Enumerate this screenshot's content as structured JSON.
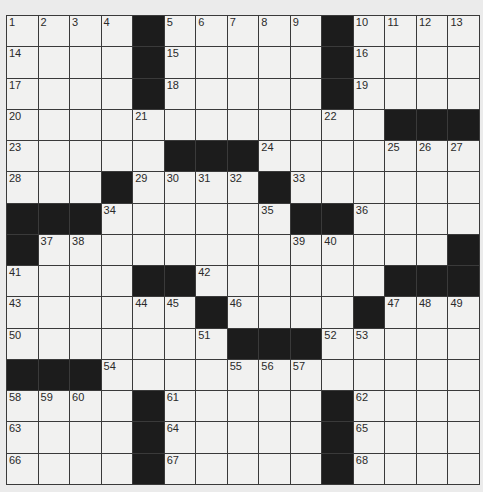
{
  "puzzle": {
    "rows": 15,
    "cols": 15,
    "layout": [
      "....#.....#....",
      "....#.....#....",
      "....#.....#....",
      "............###",
      ".....###.......",
      "...#....#......",
      "###......##....",
      "#.............#",
      "....##......###",
      "......#....#...",
      ".......###.....",
      "###............",
      "....#.....#....",
      "....#.....#....",
      "....#.....#...."
    ],
    "clue_numbers": [
      {
        "row": 0,
        "col": 0,
        "n": "1"
      },
      {
        "row": 0,
        "col": 1,
        "n": "2"
      },
      {
        "row": 0,
        "col": 2,
        "n": "3"
      },
      {
        "row": 0,
        "col": 3,
        "n": "4"
      },
      {
        "row": 0,
        "col": 5,
        "n": "5"
      },
      {
        "row": 0,
        "col": 6,
        "n": "6"
      },
      {
        "row": 0,
        "col": 7,
        "n": "7"
      },
      {
        "row": 0,
        "col": 8,
        "n": "8"
      },
      {
        "row": 0,
        "col": 9,
        "n": "9"
      },
      {
        "row": 0,
        "col": 11,
        "n": "10"
      },
      {
        "row": 0,
        "col": 12,
        "n": "11"
      },
      {
        "row": 0,
        "col": 13,
        "n": "12"
      },
      {
        "row": 0,
        "col": 14,
        "n": "13"
      },
      {
        "row": 1,
        "col": 0,
        "n": "14"
      },
      {
        "row": 1,
        "col": 5,
        "n": "15"
      },
      {
        "row": 1,
        "col": 11,
        "n": "16"
      },
      {
        "row": 2,
        "col": 0,
        "n": "17"
      },
      {
        "row": 2,
        "col": 5,
        "n": "18"
      },
      {
        "row": 2,
        "col": 11,
        "n": "19"
      },
      {
        "row": 3,
        "col": 0,
        "n": "20"
      },
      {
        "row": 3,
        "col": 4,
        "n": "21"
      },
      {
        "row": 3,
        "col": 10,
        "n": "22"
      },
      {
        "row": 4,
        "col": 0,
        "n": "23"
      },
      {
        "row": 4,
        "col": 8,
        "n": "24"
      },
      {
        "row": 4,
        "col": 12,
        "n": "25"
      },
      {
        "row": 4,
        "col": 13,
        "n": "26"
      },
      {
        "row": 4,
        "col": 14,
        "n": "27"
      },
      {
        "row": 5,
        "col": 0,
        "n": "28"
      },
      {
        "row": 5,
        "col": 4,
        "n": "29"
      },
      {
        "row": 5,
        "col": 5,
        "n": "30"
      },
      {
        "row": 5,
        "col": 6,
        "n": "31"
      },
      {
        "row": 5,
        "col": 7,
        "n": "32"
      },
      {
        "row": 5,
        "col": 9,
        "n": "33"
      },
      {
        "row": 6,
        "col": 3,
        "n": "34"
      },
      {
        "row": 6,
        "col": 8,
        "n": "35"
      },
      {
        "row": 6,
        "col": 11,
        "n": "36"
      },
      {
        "row": 7,
        "col": 1,
        "n": "37"
      },
      {
        "row": 7,
        "col": 2,
        "n": "38"
      },
      {
        "row": 7,
        "col": 9,
        "n": "39"
      },
      {
        "row": 7,
        "col": 10,
        "n": "40"
      },
      {
        "row": 8,
        "col": 0,
        "n": "41"
      },
      {
        "row": 8,
        "col": 6,
        "n": "42"
      },
      {
        "row": 9,
        "col": 0,
        "n": "43"
      },
      {
        "row": 9,
        "col": 4,
        "n": "44"
      },
      {
        "row": 9,
        "col": 5,
        "n": "45"
      },
      {
        "row": 9,
        "col": 7,
        "n": "46"
      },
      {
        "row": 9,
        "col": 12,
        "n": "47"
      },
      {
        "row": 9,
        "col": 13,
        "n": "48"
      },
      {
        "row": 9,
        "col": 14,
        "n": "49"
      },
      {
        "row": 10,
        "col": 0,
        "n": "50"
      },
      {
        "row": 10,
        "col": 6,
        "n": "51"
      },
      {
        "row": 10,
        "col": 10,
        "n": "52"
      },
      {
        "row": 10,
        "col": 11,
        "n": "53"
      },
      {
        "row": 11,
        "col": 3,
        "n": "54"
      },
      {
        "row": 11,
        "col": 7,
        "n": "55"
      },
      {
        "row": 11,
        "col": 8,
        "n": "56"
      },
      {
        "row": 11,
        "col": 9,
        "n": "57"
      },
      {
        "row": 12,
        "col": 0,
        "n": "58"
      },
      {
        "row": 12,
        "col": 1,
        "n": "59"
      },
      {
        "row": 12,
        "col": 2,
        "n": "60"
      },
      {
        "row": 12,
        "col": 5,
        "n": "61"
      },
      {
        "row": 12,
        "col": 11,
        "n": "62"
      },
      {
        "row": 13,
        "col": 0,
        "n": "63"
      },
      {
        "row": 13,
        "col": 5,
        "n": "64"
      },
      {
        "row": 13,
        "col": 11,
        "n": "65"
      },
      {
        "row": 14,
        "col": 0,
        "n": "66"
      },
      {
        "row": 14,
        "col": 5,
        "n": "67"
      },
      {
        "row": 14,
        "col": 11,
        "n": "68"
      }
    ],
    "entries": {}
  },
  "colors": {
    "background": "#ebebeb",
    "cell": "#f1f1f0",
    "block": "#1c1c1c",
    "grid_line": "#3a3a3a"
  }
}
